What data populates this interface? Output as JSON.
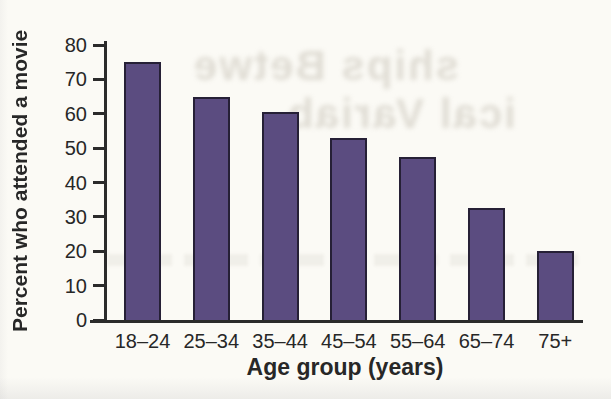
{
  "page": {
    "background": "#fbfaf5"
  },
  "chart_data": {
    "type": "bar",
    "title": "",
    "categories": [
      "18–24",
      "25–34",
      "35–44",
      "45–54",
      "55–64",
      "65–74",
      "75+"
    ],
    "values": [
      75,
      65,
      60.5,
      53,
      47.5,
      32.5,
      20
    ],
    "xlabel": "Age group (years)",
    "ylabel": "Percent who attended a movie",
    "ylim": [
      0,
      80
    ],
    "yticks": [
      0,
      10,
      20,
      30,
      40,
      50,
      60,
      70,
      80
    ],
    "grid": false,
    "legend_position": "none",
    "bar_color": "#5b4c80",
    "bar_border_color": "#262036",
    "axis_color": "#2b2b2b",
    "text_color": "#272727"
  },
  "bleed_through": {
    "lines": [
      "ships Betwe",
      "ical Variab"
    ]
  }
}
